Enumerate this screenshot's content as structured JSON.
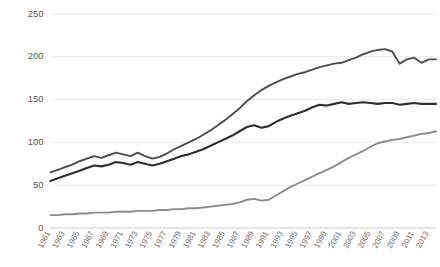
{
  "chart_data": {
    "type": "line",
    "title": "",
    "subtitle": "",
    "xlabel": "",
    "ylabel": "",
    "xlim": [
      1961,
      2014
    ],
    "ylim": [
      0,
      250
    ],
    "yticks": [
      0,
      50,
      100,
      150,
      200,
      250
    ],
    "grid": true,
    "legend": "none",
    "x": [
      1961,
      1962,
      1963,
      1964,
      1965,
      1966,
      1967,
      1968,
      1969,
      1970,
      1971,
      1972,
      1973,
      1974,
      1975,
      1976,
      1977,
      1978,
      1979,
      1980,
      1981,
      1982,
      1983,
      1984,
      1985,
      1986,
      1987,
      1988,
      1989,
      1990,
      1991,
      1992,
      1993,
      1994,
      1995,
      1996,
      1997,
      1998,
      1999,
      2000,
      2001,
      2002,
      2003,
      2004,
      2005,
      2006,
      2007,
      2008,
      2009,
      2010,
      2011,
      2012,
      2013,
      2014
    ],
    "tick_labels": [
      "1961",
      "1963",
      "1965",
      "1967",
      "1969",
      "1971",
      "1973",
      "1975",
      "1977",
      "1979",
      "1981",
      "1983",
      "1985",
      "1987",
      "1989",
      "1991",
      "1993",
      "1995",
      "1997",
      "1999",
      "2001",
      "2003",
      "2005",
      "2007",
      "2009",
      "2011",
      "2013"
    ],
    "series": [
      {
        "name": "upper-series",
        "color": "#4d4d4d",
        "width": 1.9,
        "values": [
          65,
          68,
          71,
          74,
          78,
          81,
          84,
          82,
          85,
          88,
          86,
          84,
          88,
          84,
          81,
          83,
          87,
          92,
          96,
          100,
          104,
          109,
          114,
          120,
          126,
          133,
          140,
          148,
          155,
          161,
          166,
          170,
          174,
          177,
          180,
          182,
          185,
          188,
          190,
          192,
          193,
          196,
          199,
          203,
          206,
          208,
          209,
          206,
          192,
          197,
          199,
          193,
          197,
          197
        ]
      },
      {
        "name": "middle-series",
        "color": "#2f2f2f",
        "width": 2.1,
        "values": [
          55,
          58,
          61,
          64,
          67,
          70,
          73,
          72,
          74,
          77,
          76,
          74,
          77,
          75,
          73,
          75,
          78,
          81,
          84,
          86,
          89,
          92,
          96,
          100,
          104,
          108,
          113,
          118,
          120,
          117,
          119,
          124,
          128,
          131,
          134,
          137,
          141,
          144,
          143,
          145,
          147,
          145,
          146,
          147,
          146,
          145,
          146,
          146,
          144,
          145,
          146,
          145,
          145,
          145
        ]
      },
      {
        "name": "lower-series",
        "color": "#8c8c8c",
        "width": 1.9,
        "values": [
          15,
          15,
          16,
          16,
          17,
          17,
          18,
          18,
          18,
          19,
          19,
          19,
          20,
          20,
          20,
          21,
          21,
          22,
          22,
          23,
          23,
          24,
          25,
          26,
          27,
          28,
          30,
          33,
          34,
          32,
          33,
          38,
          43,
          48,
          52,
          56,
          60,
          64,
          68,
          72,
          77,
          82,
          86,
          90,
          95,
          99,
          101,
          103,
          104,
          106,
          108,
          110,
          111,
          113
        ]
      }
    ]
  }
}
